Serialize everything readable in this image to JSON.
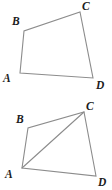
{
  "figure_set": {
    "title": "Two quadrilaterals ABCD",
    "background_color": "#ffffff",
    "stroke_color": "#8c8c8c",
    "label_color": "#1c1c1c",
    "canvas": {
      "width": 112,
      "height": 190
    }
  },
  "chart_data": {
    "type": "diagram",
    "xlabel": "",
    "ylabel": "",
    "figures": [
      {
        "id": "figure-top",
        "name": "quadrilateral-abcd-plain",
        "shape": "quadrilateral",
        "vertices": [
          {
            "label": "A",
            "x": 20,
            "y": 73
          },
          {
            "label": "B",
            "x": 24,
            "y": 31
          },
          {
            "label": "C",
            "x": 80,
            "y": 12
          },
          {
            "label": "D",
            "x": 93,
            "y": 78
          }
        ],
        "edges": [
          {
            "from": "A",
            "to": "B"
          },
          {
            "from": "B",
            "to": "C"
          },
          {
            "from": "C",
            "to": "D"
          },
          {
            "from": "D",
            "to": "A"
          }
        ],
        "diagonals": [],
        "label_positions": [
          {
            "label": "A",
            "x": 3,
            "y": 82
          },
          {
            "label": "B",
            "x": 12,
            "y": 25
          },
          {
            "label": "C",
            "x": 82,
            "y": 10
          },
          {
            "label": "D",
            "x": 96,
            "y": 89
          }
        ]
      },
      {
        "id": "figure-bottom",
        "name": "quadrilateral-abcd-with-diagonal",
        "shape": "quadrilateral",
        "vertices": [
          {
            "label": "A",
            "x": 22,
            "y": 168
          },
          {
            "label": "B",
            "x": 28,
            "y": 128
          },
          {
            "label": "C",
            "x": 84,
            "y": 112
          },
          {
            "label": "D",
            "x": 96,
            "y": 176
          }
        ],
        "edges": [
          {
            "from": "A",
            "to": "B"
          },
          {
            "from": "B",
            "to": "C"
          },
          {
            "from": "C",
            "to": "D"
          },
          {
            "from": "D",
            "to": "A"
          }
        ],
        "diagonals": [
          {
            "from": "A",
            "to": "C"
          }
        ],
        "label_positions": [
          {
            "label": "A",
            "x": 5,
            "y": 178
          },
          {
            "label": "B",
            "x": 16,
            "y": 123
          },
          {
            "label": "C",
            "x": 86,
            "y": 110
          },
          {
            "label": "D",
            "x": 98,
            "y": 186
          }
        ]
      }
    ]
  }
}
